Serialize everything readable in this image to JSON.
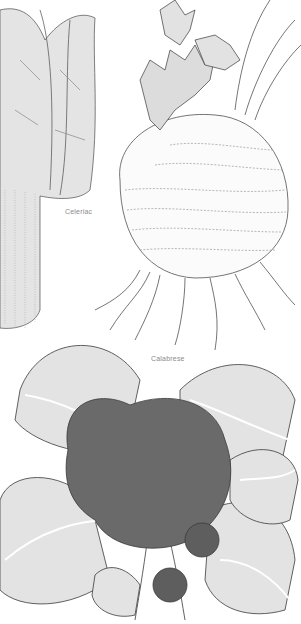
{
  "illustration": {
    "labels": {
      "celeriac": "Celeriac",
      "calabrese": "Calabrese"
    },
    "subjects": [
      "Swiss chard (partial, left edge)",
      "Celeriac",
      "Calabrese"
    ],
    "colors": {
      "background": "#ffffff",
      "line": "#3a3a3a",
      "leaf_fill": "#e6e6e6",
      "leaf_dark": "#bdbdbd",
      "floret": "#5a5a5a",
      "label": "#8a8a8a"
    }
  }
}
